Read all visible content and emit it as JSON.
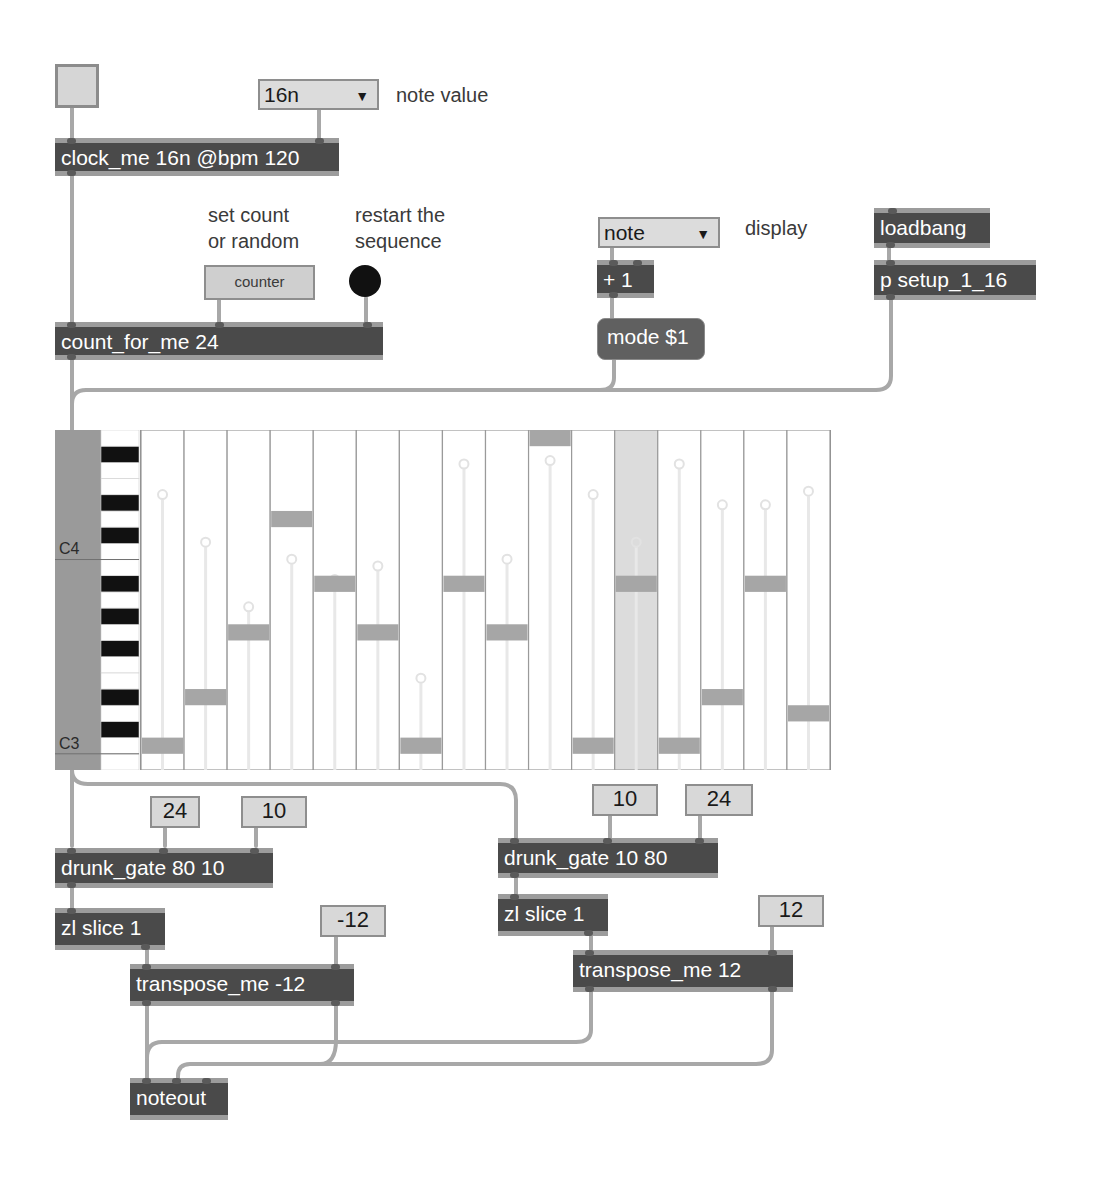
{
  "patch": {
    "toggle": {
      "state": false
    },
    "note_value_menu": {
      "selected": "16n",
      "label": "note value"
    },
    "clock": {
      "text": "clock_me 16n @bpm 120"
    },
    "counter_comment": {
      "line1": "set count",
      "line2": "or random"
    },
    "restart_comment": {
      "line1": "restart the",
      "line2": "sequence"
    },
    "counter_button": {
      "label": "counter"
    },
    "count_for_me": {
      "text": "count_for_me 24"
    },
    "display_menu": {
      "selected": "note",
      "label": "display"
    },
    "plus_one": {
      "text": "+ 1"
    },
    "mode_msg": {
      "text": "mode $1"
    },
    "loadbang": {
      "text": "loadbang"
    },
    "setup": {
      "text": "p setup_1_16"
    },
    "left_chain": {
      "num_a": "24",
      "num_b": "10",
      "drunk": "drunk_gate 80 10",
      "zl": "zl slice 1",
      "transpose_num": "-12",
      "transpose": "transpose_me -12"
    },
    "right_chain": {
      "num_a": "10",
      "num_b": "24",
      "drunk": "drunk_gate 10 80",
      "zl": "zl slice 1",
      "transpose_num": "12",
      "transpose": "transpose_me 12"
    },
    "noteout": {
      "text": "noteout"
    }
  },
  "sequencer": {
    "key_labels": {
      "c4": "C4",
      "c3": "C3"
    },
    "range_midi": [
      47,
      67
    ],
    "steps": 16,
    "current_step": 12,
    "notes": [
      48,
      51,
      55,
      62,
      58,
      55,
      48,
      58,
      55,
      67,
      48,
      58,
      48,
      51,
      58,
      50
    ],
    "velocities": [
      0.81,
      0.67,
      0.48,
      0.62,
      0.56,
      0.6,
      0.27,
      0.9,
      0.62,
      0.91,
      0.81,
      0.67,
      0.9,
      0.78,
      0.78,
      0.82
    ]
  }
}
